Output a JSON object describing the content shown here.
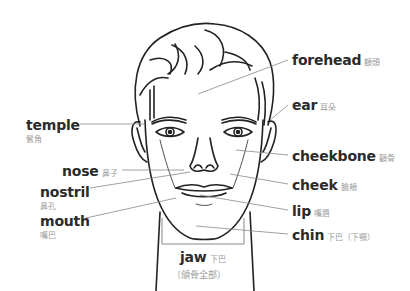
{
  "diagram": {
    "colors": {
      "line": "#222222",
      "leader": "#888888",
      "label_en": "#2b2b2b",
      "label_zh": "#9a9a9a",
      "background": "#ffffff"
    },
    "labels": {
      "forehead": {
        "en": "forehead",
        "zh": "額頭"
      },
      "ear": {
        "en": "ear",
        "zh": "耳朵"
      },
      "temple": {
        "en": "temple",
        "zh": "鬢角"
      },
      "cheekbone": {
        "en": "cheekbone",
        "zh": "顴骨"
      },
      "nose": {
        "en": "nose",
        "zh": "鼻子"
      },
      "cheek": {
        "en": "cheek",
        "zh": "臉頰"
      },
      "nostril": {
        "en": "nostril",
        "zh": "鼻孔"
      },
      "lip": {
        "en": "lip",
        "zh": "嘴唇"
      },
      "mouth": {
        "en": "mouth",
        "zh": "嘴巴"
      },
      "chin": {
        "en": "chin",
        "zh": "下巴（下顎）"
      },
      "jaw": {
        "en": "jaw",
        "zh": "下巴",
        "note": "（頜骨全部）"
      }
    }
  }
}
